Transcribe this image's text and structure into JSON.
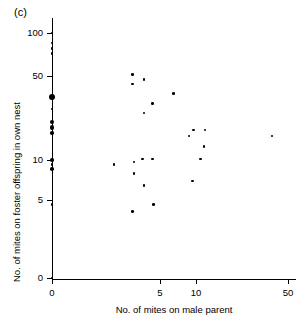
{
  "figure": {
    "panel_label": "(c)",
    "xlabel": "No. of mites on male parent",
    "ylabel": "No. of mites on foster offspring in own nest"
  },
  "chart_data": {
    "type": "scatter",
    "title": "(c)",
    "xlabel": "No. of mites on male parent",
    "ylabel": "No. of mites on foster offspring in own nest",
    "grid": false,
    "legend": null,
    "xscale": "log-like (0, 5, 10, 50)",
    "yscale": "log-like (0, 5, 10, 50, 100)",
    "xticks": [
      0,
      5,
      10,
      50
    ],
    "xticklabels": [
      "0",
      "5",
      "10",
      "50"
    ],
    "yticks": [
      0,
      5,
      10,
      50,
      100
    ],
    "yticklabels": [
      "0",
      "5",
      "10",
      "50",
      "100"
    ],
    "xlim": [
      0,
      50
    ],
    "ylim": [
      0,
      100
    ],
    "marker_note": "Marker area scales with number of overlapping observations",
    "points": [
      {
        "x": 0,
        "y": 100,
        "n": 1
      },
      {
        "x": 0,
        "y": 85,
        "n": 1
      },
      {
        "x": 0,
        "y": 78,
        "n": 1
      },
      {
        "x": 0,
        "y": 72,
        "n": 1
      },
      {
        "x": 0,
        "y": 34,
        "n": 6
      },
      {
        "x": 0,
        "y": 27,
        "n": 1
      },
      {
        "x": 0,
        "y": 21,
        "n": 3
      },
      {
        "x": 0,
        "y": 19,
        "n": 4
      },
      {
        "x": 0,
        "y": 17,
        "n": 2
      },
      {
        "x": 0,
        "y": 10,
        "n": 2
      },
      {
        "x": 0,
        "y": 9.3,
        "n": 1
      },
      {
        "x": 0,
        "y": 8.6,
        "n": 2
      },
      {
        "x": 0,
        "y": 4.4,
        "n": 1
      },
      {
        "x": 0,
        "y": 0,
        "n": 1
      },
      {
        "x": 1.8,
        "y": 9.3,
        "n": 1
      },
      {
        "x": 2.8,
        "y": 51,
        "n": 1
      },
      {
        "x": 2.8,
        "y": 43,
        "n": 1
      },
      {
        "x": 2.9,
        "y": 9.7,
        "n": 1
      },
      {
        "x": 2.9,
        "y": 8.0,
        "n": 1
      },
      {
        "x": 2.8,
        "y": 3.6,
        "n": 1
      },
      {
        "x": 3.6,
        "y": 47,
        "n": 1
      },
      {
        "x": 3.6,
        "y": 25,
        "n": 1
      },
      {
        "x": 3.5,
        "y": 10.2,
        "n": 1
      },
      {
        "x": 3.6,
        "y": 6.5,
        "n": 1
      },
      {
        "x": 4.3,
        "y": 30,
        "n": 1
      },
      {
        "x": 4.3,
        "y": 10.2,
        "n": 1
      },
      {
        "x": 4.4,
        "y": 4.4,
        "n": 1
      },
      {
        "x": 6.5,
        "y": 36,
        "n": 1
      },
      {
        "x": 8.8,
        "y": 16,
        "n": 1
      },
      {
        "x": 9.5,
        "y": 18,
        "n": 1
      },
      {
        "x": 9.4,
        "y": 7.0,
        "n": 1
      },
      {
        "x": 10.8,
        "y": 10.2,
        "n": 1
      },
      {
        "x": 11.8,
        "y": 18,
        "n": 1
      },
      {
        "x": 11.6,
        "y": 13,
        "n": 1
      },
      {
        "x": 38,
        "y": 16,
        "n": 1
      }
    ]
  }
}
